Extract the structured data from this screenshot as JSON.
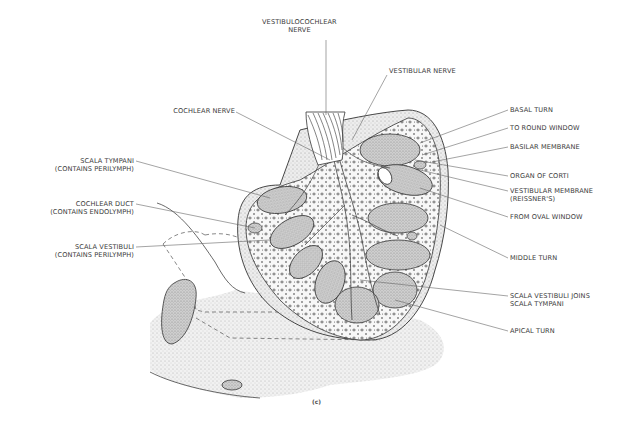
{
  "figure": {
    "caption": "(c)"
  },
  "labels": {
    "vestibulocochlear_nerve": [
      "VESTIBULOCOCHLEAR",
      "NERVE"
    ],
    "vestibular_nerve": [
      "VESTIBULAR NERVE"
    ],
    "cochlear_nerve": [
      "COCHLEAR NERVE"
    ],
    "scala_tympani": [
      "SCALA TYMPANI",
      "(CONTAINS PERILYMPH)"
    ],
    "cochlear_duct": [
      "COCHLEAR DUCT",
      "(CONTAINS ENDOLYMPH)"
    ],
    "scala_vestibuli": [
      "SCALA VESTIBULI",
      "(CONTAINS PERILYMPH)"
    ],
    "basal_turn": [
      "BASAL TURN"
    ],
    "to_round_window": [
      "TO ROUND WINDOW"
    ],
    "basilar_membrane": [
      "BASILAR  MEMBRANE"
    ],
    "organ_of_corti": [
      "ORGAN OF CORTI"
    ],
    "vestibular_membrane": [
      "VESTIBULAR MEMBRANE",
      "(REISSNER'S)"
    ],
    "from_oval_window": [
      "FROM OVAL WINDOW"
    ],
    "middle_turn": [
      "MIDDLE TURN"
    ],
    "scala_vestibuli_joins": [
      "SCALA VESTIBULI JOINS",
      "SCALA TYMPANI"
    ],
    "apical_turn": [
      "APICAL TURN"
    ]
  },
  "colors": {
    "ink": "#3a3a3a",
    "leader": "#666666",
    "stipple": "#c9c9c9",
    "chamber": "#bdbdbd",
    "background": "#ffffff"
  }
}
